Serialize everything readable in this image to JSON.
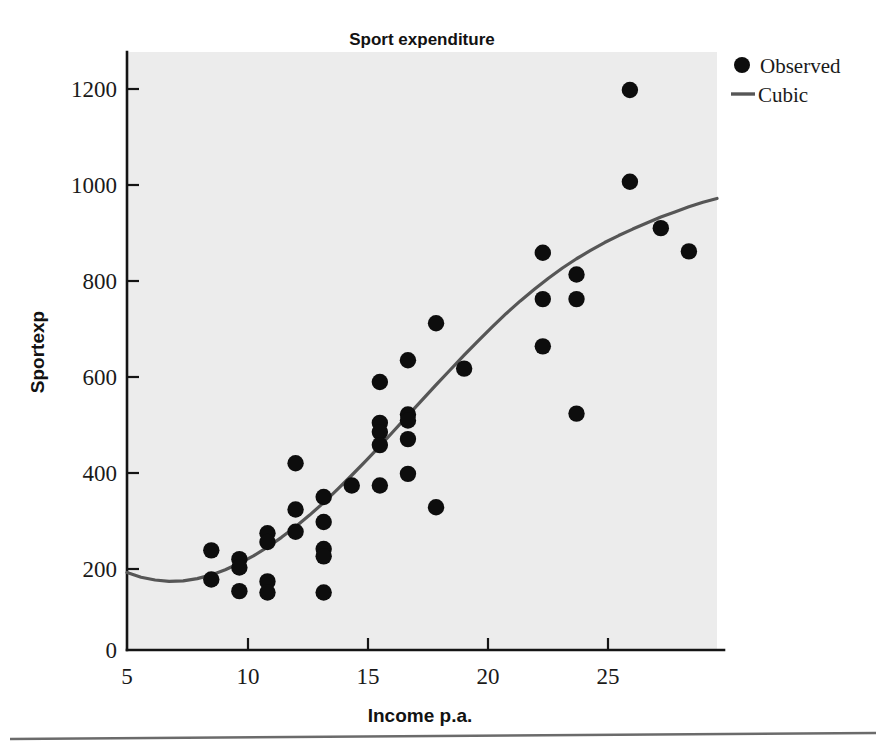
{
  "chart_data": {
    "type": "scatter",
    "title": "Sport expenditure",
    "xlabel": "Income p.a.",
    "ylabel": "Sportexp",
    "xlim": [
      5,
      26
    ],
    "ylim": [
      0,
      1290
    ],
    "xticks": [
      5,
      10,
      15,
      20,
      25
    ],
    "yticks": [
      0,
      200,
      400,
      600,
      800,
      1000,
      1200
    ],
    "xtick_labels": [
      "5",
      "10",
      "15",
      "20",
      "25"
    ],
    "ytick_labels": [
      "0",
      "200",
      "400",
      "600",
      "800",
      "1000",
      "1200"
    ],
    "grid": false,
    "legend_position": "top-right",
    "legend": [
      {
        "label": "Observed",
        "marker": "circle",
        "color": "#0d0d0d"
      },
      {
        "label": "Cubic",
        "marker": "line",
        "color": "#565656"
      }
    ],
    "series": [
      {
        "name": "Observed",
        "type": "scatter",
        "marker": "circle",
        "color": "#0d0d0d",
        "points": [
          [
            8.0,
            215
          ],
          [
            8.0,
            152
          ],
          [
            9.0,
            196
          ],
          [
            9.0,
            178
          ],
          [
            9.0,
            127
          ],
          [
            10.0,
            252
          ],
          [
            10.0,
            233
          ],
          [
            10.0,
            148
          ],
          [
            10.0,
            124
          ],
          [
            11.0,
            403
          ],
          [
            11.0,
            303
          ],
          [
            11.0,
            255
          ],
          [
            12.0,
            330
          ],
          [
            12.0,
            276
          ],
          [
            12.0,
            218
          ],
          [
            12.0,
            202
          ],
          [
            12.0,
            124
          ],
          [
            13.0,
            355
          ],
          [
            14.0,
            578
          ],
          [
            14.0,
            490
          ],
          [
            14.0,
            470
          ],
          [
            14.0,
            442
          ],
          [
            14.0,
            355
          ],
          [
            15.0,
            625
          ],
          [
            15.0,
            508
          ],
          [
            15.0,
            495
          ],
          [
            15.0,
            455
          ],
          [
            15.0,
            380
          ],
          [
            16.0,
            705
          ],
          [
            16.0,
            308
          ],
          [
            17.0,
            607
          ],
          [
            19.8,
            857
          ],
          [
            19.8,
            757
          ],
          [
            19.8,
            655
          ],
          [
            21.0,
            810
          ],
          [
            21.0,
            757
          ],
          [
            21.0,
            510
          ],
          [
            22.9,
            1208
          ],
          [
            22.9,
            1010
          ],
          [
            24.0,
            910
          ],
          [
            25.0,
            860
          ]
        ]
      },
      {
        "name": "Cubic",
        "type": "line",
        "color": "#565656",
        "points": [
          [
            5.0,
            167
          ],
          [
            5.5,
            157
          ],
          [
            6.0,
            151
          ],
          [
            6.5,
            148
          ],
          [
            7.0,
            149
          ],
          [
            7.5,
            154
          ],
          [
            8.0,
            162
          ],
          [
            8.5,
            173
          ],
          [
            9.0,
            187
          ],
          [
            9.5,
            203
          ],
          [
            10.0,
            222
          ],
          [
            10.5,
            243
          ],
          [
            11.0,
            266
          ],
          [
            11.5,
            291
          ],
          [
            12.0,
            318
          ],
          [
            12.5,
            347
          ],
          [
            13.0,
            377
          ],
          [
            13.5,
            408
          ],
          [
            14.0,
            440
          ],
          [
            14.5,
            473
          ],
          [
            15.0,
            506
          ],
          [
            15.5,
            539
          ],
          [
            16.0,
            572
          ],
          [
            16.5,
            604
          ],
          [
            17.0,
            636
          ],
          [
            17.5,
            667
          ],
          [
            18.0,
            697
          ],
          [
            18.5,
            726
          ],
          [
            19.0,
            753
          ],
          [
            19.5,
            778
          ],
          [
            20.0,
            802
          ],
          [
            20.5,
            824
          ],
          [
            21.0,
            844
          ],
          [
            21.5,
            862
          ],
          [
            22.0,
            879
          ],
          [
            22.5,
            894
          ],
          [
            23.0,
            908
          ],
          [
            23.5,
            921
          ],
          [
            24.0,
            934
          ],
          [
            24.5,
            945
          ],
          [
            25.0,
            956
          ],
          [
            25.5,
            966
          ],
          [
            26.0,
            974
          ]
        ]
      }
    ]
  },
  "figure": {
    "background_color": "#ffffff",
    "plot_background_color": "#ececec",
    "axis_color": "#141414",
    "footer_rule": "divider"
  }
}
